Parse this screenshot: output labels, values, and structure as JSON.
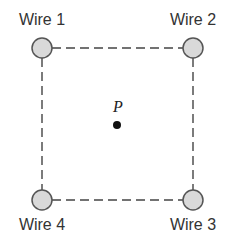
{
  "diagram": {
    "wires": [
      {
        "label": "Wire 1",
        "position": "top-left"
      },
      {
        "label": "Wire 2",
        "position": "top-right"
      },
      {
        "label": "Wire 3",
        "position": "bottom-right"
      },
      {
        "label": "Wire 4",
        "position": "bottom-left"
      }
    ],
    "point": {
      "label": "P",
      "position": "center"
    },
    "colors": {
      "wire_fill": "#d9d9d9",
      "wire_stroke": "#555555",
      "line": "#444444",
      "dot": "#111111"
    }
  }
}
